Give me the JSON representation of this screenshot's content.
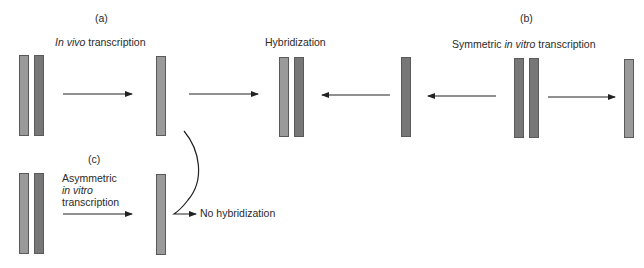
{
  "panels": {
    "a": {
      "label": "(a)",
      "caption_italic": "In vivo",
      "caption_rest": " transcription"
    },
    "hybridization": {
      "caption": "Hybridization"
    },
    "b": {
      "label": "(b)",
      "caption_pre": "Symmetric ",
      "caption_italic": "in vitro",
      "caption_rest": " transcription"
    },
    "c": {
      "label": "(c)",
      "caption_line1": "Asymmetric",
      "caption_line2_italic": "in vitro",
      "caption_line3": "transcription",
      "result": "No hybridization"
    }
  },
  "colors": {
    "strand_light": "#9a9a9a",
    "strand_dark": "#777777",
    "arrow": "#222222"
  }
}
